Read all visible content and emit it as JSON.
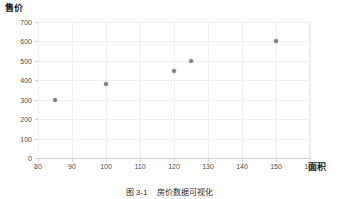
{
  "chart_data": {
    "type": "scatter",
    "title": "",
    "xlabel": "面积",
    "ylabel": "售价",
    "xlim": [
      80,
      160
    ],
    "ylim": [
      0,
      700
    ],
    "grid": true,
    "legend": null,
    "x_ticks": [
      "80",
      "90",
      "100",
      "110",
      "120",
      "130",
      "140",
      "150",
      "160"
    ],
    "y_ticks": [
      "0",
      "100",
      "200",
      "300",
      "400",
      "500",
      "600",
      "700"
    ],
    "points": [
      {
        "x": 85,
        "y": 300
      },
      {
        "x": 100,
        "y": 380
      },
      {
        "x": 120,
        "y": 450
      },
      {
        "x": 125,
        "y": 500
      },
      {
        "x": 150,
        "y": 600
      }
    ],
    "marker_color": "#808080",
    "grid_color": "#f0f0f0",
    "axis_color": "#d0d0d0",
    "background": "#ffffff"
  },
  "caption": {
    "number": "图 3-1",
    "text": "房价数据可视化"
  }
}
